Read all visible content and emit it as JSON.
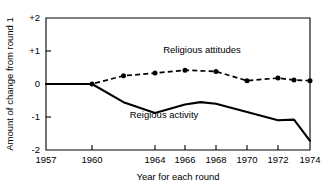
{
  "chart_data": {
    "type": "line",
    "title": "",
    "xlabel": "Year for each round",
    "ylabel": "Amount of change from round 1",
    "xlim": [
      1957,
      1974
    ],
    "ylim": [
      -2,
      2
    ],
    "grid": false,
    "legend": "inline-annotations",
    "y_ticks": [
      "+2",
      "+1",
      "0",
      "-1",
      "-2"
    ],
    "y_tick_values": [
      2,
      1,
      0,
      -1,
      -2
    ],
    "x_ticks": [
      "1957",
      "1960",
      "1964",
      "1966",
      "1968",
      "1970",
      "1972",
      "1974"
    ],
    "x_tick_values": [
      1957,
      1960,
      1964,
      1966,
      1968,
      1970,
      1972,
      1974
    ],
    "series": [
      {
        "name": "Religious attitudes",
        "style": "dashed",
        "markers": "filled-circle",
        "x": [
          1957,
          1960,
          1962,
          1964,
          1966,
          1968,
          1970,
          1972,
          1973,
          1974
        ],
        "values": [
          0.0,
          0.0,
          0.25,
          0.33,
          0.42,
          0.38,
          0.1,
          0.18,
          0.12,
          0.1
        ]
      },
      {
        "name": "Reigious activity",
        "style": "solid",
        "markers": "none",
        "x": [
          1957,
          1960,
          1962,
          1964,
          1966,
          1967,
          1968,
          1970,
          1972,
          1973,
          1974
        ],
        "values": [
          0.0,
          0.0,
          -0.55,
          -0.88,
          -0.62,
          -0.55,
          -0.6,
          -0.85,
          -1.1,
          -1.08,
          -1.72
        ]
      }
    ],
    "annotations": [
      {
        "text": "Religious attitudes",
        "x": 1967.1,
        "y": 0.95
      },
      {
        "text": "Reigious activity",
        "x": 1964.6,
        "y": -1.03
      }
    ]
  },
  "colors": {
    "ink": "#000000",
    "background": "#ffffff"
  }
}
